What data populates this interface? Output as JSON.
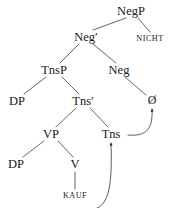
{
  "figure": {
    "type": "syntax-tree",
    "ink_color": "#1a1a1a",
    "background_color": "#ffffff",
    "nodes": [
      {
        "id": "negp",
        "label": "NegP",
        "x": 131,
        "y": 11,
        "kind": "phrase"
      },
      {
        "id": "negbar",
        "label": "Neg′",
        "x": 86,
        "y": 37,
        "kind": "bar"
      },
      {
        "id": "nicht",
        "label": "NICHT",
        "x": 150,
        "y": 39,
        "kind": "terminal"
      },
      {
        "id": "tnsp",
        "label": "TnsP",
        "x": 54,
        "y": 70,
        "kind": "phrase"
      },
      {
        "id": "neg",
        "label": "Neg",
        "x": 119,
        "y": 70,
        "kind": "head"
      },
      {
        "id": "dp1",
        "label": "DP",
        "x": 17,
        "y": 101,
        "kind": "phrase"
      },
      {
        "id": "tnsbar",
        "label": "Tns′",
        "x": 83,
        "y": 101,
        "kind": "bar"
      },
      {
        "id": "zero",
        "label": "Ø",
        "x": 152,
        "y": 100,
        "kind": "null-head"
      },
      {
        "id": "vp",
        "label": "VP",
        "x": 51,
        "y": 134,
        "kind": "phrase"
      },
      {
        "id": "tns",
        "label": "Tns",
        "x": 111,
        "y": 134,
        "kind": "head"
      },
      {
        "id": "dp2",
        "label": "DP",
        "x": 16,
        "y": 164,
        "kind": "phrase"
      },
      {
        "id": "v",
        "label": "V",
        "x": 75,
        "y": 164,
        "kind": "head"
      },
      {
        "id": "kauf",
        "label": "KAUF",
        "x": 75,
        "y": 196,
        "kind": "terminal"
      }
    ],
    "branches": [
      {
        "from": "negp",
        "to": "negbar"
      },
      {
        "from": "negp",
        "to": "nicht"
      },
      {
        "from": "negbar",
        "to": "tnsp"
      },
      {
        "from": "negbar",
        "to": "neg"
      },
      {
        "from": "tnsp",
        "to": "dp1"
      },
      {
        "from": "tnsp",
        "to": "tnsbar"
      },
      {
        "from": "neg",
        "to": "zero"
      },
      {
        "from": "tnsbar",
        "to": "vp"
      },
      {
        "from": "tnsbar",
        "to": "tns"
      },
      {
        "from": "vp",
        "to": "dp2"
      },
      {
        "from": "vp",
        "to": "v"
      },
      {
        "from": "v",
        "to": "kauf"
      }
    ],
    "movement_arrows": [
      {
        "id": "kauf-to-tns",
        "from": "kauf",
        "to": "tns",
        "label": "head movement V to Tns"
      },
      {
        "id": "tns-to-zero",
        "from": "tns",
        "to": "zero",
        "label": "head movement Tns to Neg"
      }
    ]
  }
}
